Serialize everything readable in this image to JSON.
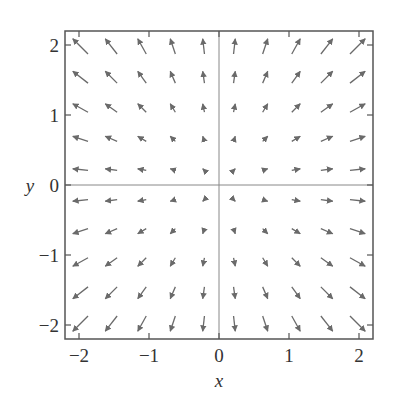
{
  "chart_data": {
    "type": "quiver",
    "title": "",
    "xlabel": "x",
    "ylabel": "y",
    "xlim": [
      -2.2,
      2.2
    ],
    "ylim": [
      -2.2,
      2.2
    ],
    "xticks": [
      -2,
      -1,
      0,
      1,
      2
    ],
    "yticks": [
      -2,
      -1,
      0,
      1,
      2
    ],
    "xtick_labels": [
      "−2",
      "−1",
      "0",
      "1",
      "2"
    ],
    "ytick_labels": [
      "−2",
      "−1",
      "0",
      "1",
      "2"
    ],
    "grid": false,
    "zero_lines": true,
    "field": "F(x, y) = (x, y)",
    "grid_points": [
      -1.98,
      -1.54,
      -1.1,
      -0.66,
      -0.22,
      0.22,
      0.66,
      1.1,
      1.54,
      1.98
    ],
    "arrow_scale": 0.11,
    "colors": {
      "arrow": "#6a6a6a",
      "frame": "#555555",
      "zero_line": "#888888",
      "text": "#333333"
    }
  }
}
